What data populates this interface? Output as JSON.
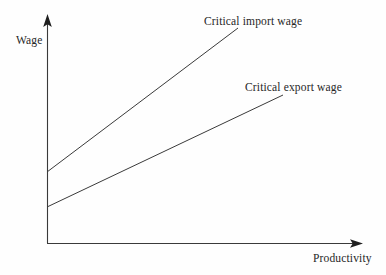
{
  "figure": {
    "background_color": "#fefefe",
    "stroke_color": "#3a3a3a",
    "text_color": "#262626"
  },
  "axes": {
    "y_label": "Wage",
    "x_label": "Productivity",
    "origin": [
      47,
      243
    ],
    "y_axis_top": [
      47,
      16
    ],
    "x_axis_right": [
      362,
      243
    ]
  },
  "labels": {
    "import_line": "Critical import wage",
    "export_line": "Critical export wage"
  },
  "chart_data": {
    "type": "line",
    "title": "",
    "xlabel": "Productivity",
    "ylabel": "Wage",
    "xlim": [
      0,
      1
    ],
    "ylim": [
      0,
      1
    ],
    "grid": false,
    "legend": "inline-annotations",
    "axes_style": "arrow-tipped, no tick marks, no tick labels",
    "series": [
      {
        "name": "Critical import wage",
        "annotation": "Critical import wage",
        "slope_pixels": -0.754,
        "points_pixels": [
          [
            47,
            172
          ],
          [
            238,
            28
          ]
        ],
        "points_normalized": [
          [
            0.0,
            0.313
          ],
          [
            0.607,
            0.947
          ]
        ]
      },
      {
        "name": "Critical export wage",
        "annotation": "Critical export wage",
        "slope_pixels": -0.475,
        "points_pixels": [
          [
            47,
            207
          ],
          [
            283,
            95
          ]
        ],
        "points_normalized": [
          [
            0.0,
            0.159
          ],
          [
            0.749,
            0.652
          ]
        ]
      }
    ]
  }
}
